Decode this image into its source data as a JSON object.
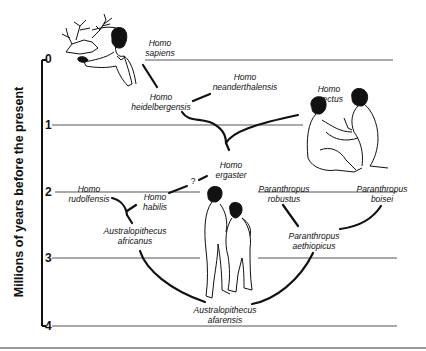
{
  "diagram": {
    "y_axis_title": "Millions of years before the present",
    "ticks": [
      "0",
      "1",
      "2",
      "3",
      "4"
    ],
    "question_mark": "?",
    "species": {
      "sapiens": {
        "genus": "Homo",
        "species": "sapiens"
      },
      "heidelbergensis": {
        "genus": "Homo",
        "species": "heidelbergensis"
      },
      "neanderthalensis": {
        "genus": "Homo",
        "species": "neanderthalensis"
      },
      "erectus": {
        "genus": "Homo",
        "species": "erectus"
      },
      "ergaster": {
        "genus": "Homo",
        "species": "ergaster"
      },
      "rudolfensis": {
        "genus": "Homo",
        "species": "rudolfensis"
      },
      "habilis": {
        "genus": "Homo",
        "species": "habilis"
      },
      "africanus": {
        "genus": "Australopithecus",
        "species": "africanus"
      },
      "robustus": {
        "genus": "Paranthropus",
        "species": "robustus"
      },
      "boisei": {
        "genus": "Paranthropus",
        "species": "boisei"
      },
      "aethiopicus": {
        "genus": "Paranthropus",
        "species": "aethiopicus"
      },
      "afarensis": {
        "genus": "Australopithecus",
        "species": "afarensis"
      }
    },
    "illustrations": [
      "cave-painter-with-deer",
      "homo-erectus-pair",
      "australopithecus-pair"
    ]
  }
}
